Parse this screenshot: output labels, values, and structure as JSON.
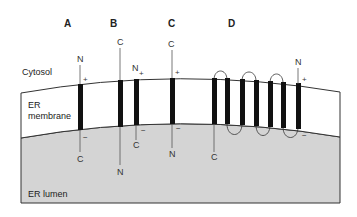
{
  "regions": {
    "cytosol": "Cytosol",
    "membrane_line1": "ER",
    "membrane_line2": "membrane",
    "lumen": "ER lumen"
  },
  "colors": {
    "lumen_fill": "#d4d4d4",
    "membrane_fill": "#ffffff",
    "segment": "#111111",
    "outline": "#333333"
  },
  "proteins": [
    {
      "id": "A",
      "label": "A",
      "segments": 1,
      "termini": [
        {
          "label": "N",
          "side": "cytosol",
          "charge": "+"
        },
        {
          "label": "C",
          "side": "lumen",
          "charge": "−"
        }
      ]
    },
    {
      "id": "B",
      "label": "B",
      "segments": 2,
      "termini": [
        {
          "label": "C",
          "side": "cytosol",
          "charge": ""
        },
        {
          "label": "N",
          "side": "lumen",
          "charge": ""
        },
        {
          "label": "N",
          "side": "cytosol",
          "charge": "+"
        },
        {
          "label": "C",
          "side": "lumen",
          "charge": "−"
        }
      ]
    },
    {
      "id": "C",
      "label": "C",
      "segments": 1,
      "termini": [
        {
          "label": "C",
          "side": "cytosol",
          "charge": "+"
        },
        {
          "label": "N",
          "side": "lumen",
          "charge": "−"
        }
      ]
    },
    {
      "id": "D",
      "label": "D",
      "segments": 7,
      "termini": [
        {
          "label": "C",
          "side": "lumen",
          "charge": ""
        },
        {
          "label": "N",
          "side": "cytosol",
          "charge": "+"
        },
        {
          "label": "",
          "side": "lumen",
          "charge": "−"
        }
      ]
    }
  ]
}
